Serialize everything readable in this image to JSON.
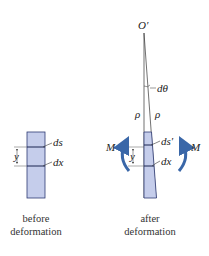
{
  "before": {
    "labels": {
      "ds": "ds",
      "dx": "dx",
      "y": "y"
    },
    "caption_line1": "before",
    "caption_line2": "deformation"
  },
  "after": {
    "labels": {
      "origin": "O′",
      "dtheta": "dθ",
      "rho_left": "ρ",
      "rho_right": "ρ",
      "ds_prime": "ds′",
      "dx": "dx",
      "y": "y",
      "moment_left": "M",
      "moment_right": "M"
    },
    "caption_line1": "after",
    "caption_line2": "deformation"
  },
  "colors": {
    "fill": "#c5cdeb",
    "stroke": "#2d3a73",
    "arrow": "#3a67a8",
    "line": "#333333"
  }
}
